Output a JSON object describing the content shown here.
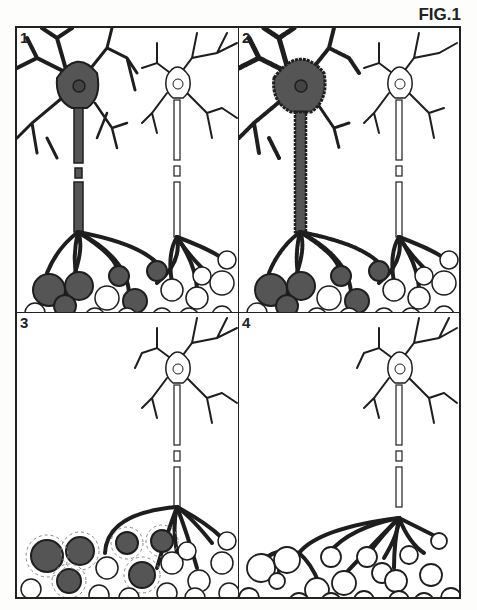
{
  "figure": {
    "label": "FIG.1"
  },
  "panels": [
    {
      "number": "1",
      "state": "affected neuron (shaded) with its innervated fibers shaded; healthy neuron unshaded"
    },
    {
      "number": "2",
      "state": "affected neuron degenerating (spiky outline)"
    },
    {
      "number": "3",
      "state": "affected neuron lost; denervated shaded fibers scattered"
    },
    {
      "number": "4",
      "state": "healthy neuron sprouts to reinnervate orphaned fibers"
    }
  ],
  "colors": {
    "ink": "#1e1e1e",
    "shade": "#555555",
    "fiber_light": "#ffffff",
    "background": "#ffffff"
  }
}
